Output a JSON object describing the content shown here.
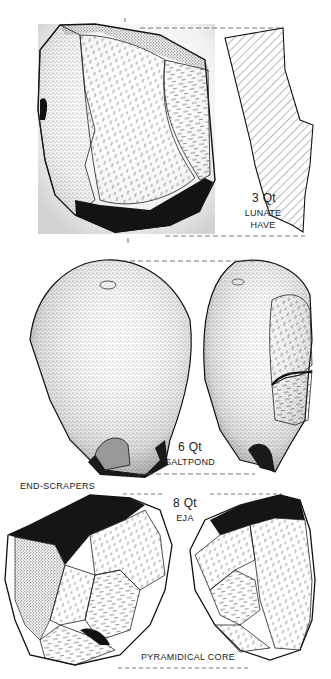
{
  "figure": {
    "type": "archaeological lithic illustration plate",
    "background": "#ffffff",
    "ink": "#1a1a1a"
  },
  "specimens": [
    {
      "id": "top",
      "number": "3",
      "material": "Qt",
      "site_lines": [
        "LUNATE",
        "HAVE"
      ],
      "views": [
        "face-view",
        "cross-section"
      ]
    },
    {
      "id": "middle",
      "number": "6",
      "material": "Qt",
      "site_lines": [
        "SALTPOND"
      ],
      "views": [
        "dorsal-view",
        "side-view"
      ]
    },
    {
      "id": "bottom",
      "number": "8",
      "material": "Qt",
      "site_lines": [
        "EJA"
      ],
      "views": [
        "front-view",
        "side-view"
      ]
    }
  ],
  "captions": {
    "group1": "END-SCRAPERS",
    "group2": "PYRAMIDICAL CORE"
  },
  "labels": {
    "s1_num": "3 Qt",
    "s1_site1": "LUNATE",
    "s1_site2": "HAVE",
    "s2_num": "6 Qt",
    "s2_site": "SALTPOND",
    "s3_num": "8 Qt",
    "s3_site": "EJA"
  }
}
